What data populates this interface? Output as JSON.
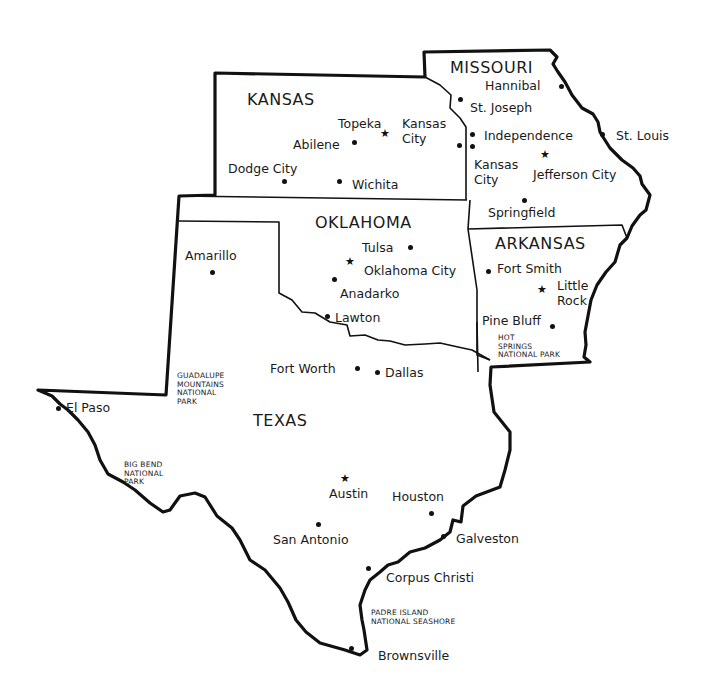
{
  "map": {
    "states": [
      {
        "name": "KANSAS",
        "x": 247,
        "y": 90
      },
      {
        "name": "MISSOURI",
        "x": 450,
        "y": 58
      },
      {
        "name": "OKLAHOMA",
        "x": 315,
        "y": 213
      },
      {
        "name": "ARKANSAS",
        "x": 495,
        "y": 234
      },
      {
        "name": "TEXAS",
        "x": 253,
        "y": 411
      }
    ],
    "cities": [
      {
        "name": "Topeka",
        "x": 338,
        "y": 116,
        "marker": "capital",
        "mx": 385,
        "my": 134
      },
      {
        "name": "Kansas\nCity",
        "x": 402,
        "y": 116,
        "marker": "none"
      },
      {
        "name": "Abilene",
        "x": 293,
        "y": 137,
        "marker": "dot",
        "mx": 354,
        "my": 142
      },
      {
        "name": "Dodge City",
        "x": 228,
        "y": 161,
        "marker": "dot",
        "mx": 284,
        "my": 181
      },
      {
        "name": "Wichita",
        "x": 352,
        "y": 177,
        "marker": "dot",
        "mx": 339,
        "my": 181
      },
      {
        "name": "Hannibal",
        "x": 485,
        "y": 78,
        "marker": "dot",
        "mx": 561,
        "my": 86
      },
      {
        "name": "St. Joseph",
        "x": 470,
        "y": 100,
        "marker": "dot",
        "mx": 460,
        "my": 99
      },
      {
        "name": "Independence",
        "x": 484,
        "y": 128,
        "marker": "dot",
        "mx": 472,
        "my": 134
      },
      {
        "name": "Kansas City (KS)",
        "x": 0,
        "y": 0,
        "marker": "dot",
        "mx": 459,
        "my": 145
      },
      {
        "name": "Kansas\nCity",
        "x": 474,
        "y": 157,
        "marker": "dot",
        "mx": 472,
        "my": 146
      },
      {
        "name": "Jefferson City",
        "x": 533,
        "y": 167,
        "marker": "capital",
        "mx": 545,
        "my": 155
      },
      {
        "name": "St. Louis",
        "x": 616,
        "y": 128,
        "marker": "dot",
        "mx": 602,
        "my": 134
      },
      {
        "name": "Springfield",
        "x": 488,
        "y": 205,
        "marker": "dot",
        "mx": 524,
        "my": 200
      },
      {
        "name": "Tulsa",
        "x": 362,
        "y": 240,
        "marker": "dot",
        "mx": 410,
        "my": 247
      },
      {
        "name": "Oklahoma City",
        "x": 364,
        "y": 263,
        "marker": "capital",
        "mx": 350,
        "my": 262
      },
      {
        "name": "Anadarko",
        "x": 340,
        "y": 286,
        "marker": "dot",
        "mx": 334,
        "my": 279
      },
      {
        "name": "Lawton",
        "x": 335,
        "y": 310,
        "marker": "dot",
        "mx": 327,
        "my": 316
      },
      {
        "name": "Amarillo",
        "x": 185,
        "y": 248,
        "marker": "dot",
        "mx": 212,
        "my": 272
      },
      {
        "name": "Fort Smith",
        "x": 497,
        "y": 261,
        "marker": "dot",
        "mx": 488,
        "my": 271
      },
      {
        "name": "Little\nRock",
        "x": 557,
        "y": 278,
        "marker": "capital",
        "mx": 542,
        "my": 290
      },
      {
        "name": "Pine Bluff",
        "x": 482,
        "y": 313,
        "marker": "dot",
        "mx": 552,
        "my": 326
      },
      {
        "name": "Fort Worth",
        "x": 270,
        "y": 361,
        "marker": "dot",
        "mx": 357,
        "my": 368
      },
      {
        "name": "Dallas",
        "x": 385,
        "y": 365,
        "marker": "dot",
        "mx": 377,
        "my": 372
      },
      {
        "name": "El Paso",
        "x": 66,
        "y": 400,
        "marker": "dot",
        "mx": 58,
        "my": 408
      },
      {
        "name": "Austin",
        "x": 329,
        "y": 486,
        "marker": "capital",
        "mx": 345,
        "my": 479
      },
      {
        "name": "Houston",
        "x": 392,
        "y": 489,
        "marker": "dot",
        "mx": 431,
        "my": 513
      },
      {
        "name": "San Antonio",
        "x": 273,
        "y": 532,
        "marker": "dot",
        "mx": 318,
        "my": 524
      },
      {
        "name": "Galveston",
        "x": 456,
        "y": 531,
        "marker": "dot",
        "mx": 443,
        "my": 536
      },
      {
        "name": "Corpus Christi",
        "x": 386,
        "y": 570,
        "marker": "dot",
        "mx": 368,
        "my": 568
      },
      {
        "name": "Brownsville",
        "x": 378,
        "y": 648,
        "marker": "dot",
        "mx": 351,
        "my": 648
      }
    ],
    "parks": [
      {
        "name": "HOT\nSPRINGS\nNATIONAL PARK",
        "x": 498,
        "y": 334
      },
      {
        "name": "GUADALUPE\nMOUNTAINS\nNATIONAL\nPARK",
        "x": 177,
        "y": 372
      },
      {
        "name": "BIG BEND\nNATIONAL\nPARK",
        "x": 124,
        "y": 461
      },
      {
        "name": "PADRE ISLAND\nNATIONAL SEASHORE",
        "x": 371,
        "y": 609
      }
    ]
  }
}
